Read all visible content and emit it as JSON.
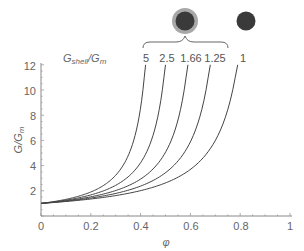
{
  "chart_data": {
    "type": "line",
    "title": "",
    "xlabel": "φ",
    "ylabel": "G/G_m",
    "xlim": [
      0,
      1
    ],
    "ylim": [
      0,
      12
    ],
    "x_ticks": [
      "0",
      "0.2",
      "0.4",
      "0.6",
      "0.8",
      "1"
    ],
    "y_ticks": [
      "2",
      "4",
      "6",
      "8",
      "10",
      "12"
    ],
    "grid": false,
    "legend_title": "G_shell/G_m",
    "annotations": [
      "core-shell particle icon",
      "plain particle icon",
      "brace grouping 5, 2.5, 1.66, 1.25 under core-shell particle"
    ],
    "series": [
      {
        "name": "5",
        "phi_end": 0.42,
        "x": [
          0,
          0.1,
          0.2,
          0.3,
          0.35,
          0.4,
          0.42
        ],
        "values": [
          1.0,
          1.32,
          1.85,
          3.0,
          4.3,
          7.8,
          12.0
        ]
      },
      {
        "name": "2.5",
        "phi_end": 0.5,
        "x": [
          0,
          0.1,
          0.2,
          0.3,
          0.4,
          0.45,
          0.5
        ],
        "values": [
          1.0,
          1.26,
          1.65,
          2.35,
          4.0,
          6.0,
          12.0
        ]
      },
      {
        "name": "1.66",
        "phi_end": 0.59,
        "x": [
          0,
          0.1,
          0.2,
          0.3,
          0.4,
          0.5,
          0.59
        ],
        "values": [
          1.0,
          1.21,
          1.5,
          1.95,
          2.8,
          4.7,
          12.0
        ]
      },
      {
        "name": "1.25",
        "phi_end": 0.68,
        "x": [
          0,
          0.1,
          0.2,
          0.3,
          0.4,
          0.5,
          0.6,
          0.68
        ],
        "values": [
          1.0,
          1.18,
          1.4,
          1.72,
          2.25,
          3.1,
          5.2,
          12.0
        ]
      },
      {
        "name": "1",
        "phi_end": 0.79,
        "x": [
          0,
          0.1,
          0.2,
          0.3,
          0.4,
          0.5,
          0.6,
          0.7,
          0.79
        ],
        "values": [
          1.0,
          1.15,
          1.33,
          1.58,
          1.95,
          2.5,
          3.5,
          5.8,
          12.0
        ]
      }
    ]
  },
  "labels": {
    "legend_title_main": "G",
    "legend_title_sub1": "shell",
    "legend_title_slash": "/G",
    "legend_title_sub2": "m",
    "y_axis_title": "G/G",
    "y_axis_sub": "m",
    "x_axis_title": "φ",
    "curve_labels": [
      "5",
      "2.5",
      "1.66",
      "1.25",
      "1"
    ]
  },
  "colors": {
    "curve": "#444444",
    "axis": "#777777",
    "particle_core": "#3a3a3a",
    "particle_shell": "#9a9a9a"
  }
}
